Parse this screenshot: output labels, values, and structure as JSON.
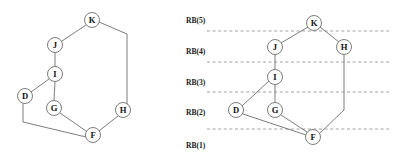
{
  "figure": {
    "width": 398,
    "height": 158,
    "background_color": "#ffffff",
    "node_fill_color": "#ffffff",
    "node_stroke_color": "#6e6e6e",
    "edge_color": "#6e6e6e",
    "band_line_color": "#8a8a8a",
    "label_color": "#111111"
  },
  "left_graph": {
    "name": "undecomposed-graph",
    "nodes": [
      {
        "id": "K",
        "label": "K",
        "x": 92,
        "y": 20,
        "r": 7.5
      },
      {
        "id": "J",
        "label": "J",
        "x": 55,
        "y": 45,
        "r": 7.5
      },
      {
        "id": "I",
        "label": "I",
        "x": 55,
        "y": 74,
        "r": 7.5
      },
      {
        "id": "D",
        "label": "D",
        "x": 25,
        "y": 96,
        "r": 7.5
      },
      {
        "id": "G",
        "label": "G",
        "x": 54,
        "y": 108,
        "r": 7.5
      },
      {
        "id": "H",
        "label": "H",
        "x": 123,
        "y": 110,
        "r": 7.5
      },
      {
        "id": "F",
        "label": "F",
        "x": 93,
        "y": 135,
        "r": 7.5
      }
    ],
    "edges": [
      {
        "from": "K",
        "to": "J",
        "points": [
          [
            86,
            25
          ],
          [
            62,
            41
          ]
        ]
      },
      {
        "from": "J",
        "to": "I",
        "points": [
          [
            55,
            53
          ],
          [
            55,
            66
          ]
        ]
      },
      {
        "from": "I",
        "to": "D",
        "points": [
          [
            49,
            79
          ],
          [
            31,
            92
          ]
        ]
      },
      {
        "from": "I",
        "to": "G",
        "points": [
          [
            55,
            82
          ],
          [
            54,
            100
          ]
        ]
      },
      {
        "from": "G",
        "to": "F",
        "points": [
          [
            60,
            113
          ],
          [
            86,
            131
          ]
        ]
      },
      {
        "from": "F",
        "to": "H",
        "points": [
          [
            99,
            131
          ],
          [
            118,
            116
          ]
        ]
      },
      {
        "from": "K",
        "to": "H",
        "points": [
          [
            99,
            22
          ],
          [
            127,
            34
          ],
          [
            127,
            104
          ],
          [
            129,
            106
          ]
        ]
      },
      {
        "from": "D",
        "to": "F",
        "points": [
          [
            23,
            104
          ],
          [
            23,
            122
          ],
          [
            86,
            137
          ]
        ]
      }
    ]
  },
  "right_graph": {
    "name": "level-decomposed-graph",
    "nodes": [
      {
        "id": "K",
        "label": "K",
        "x": 314,
        "y": 23,
        "r": 7.5
      },
      {
        "id": "J",
        "label": "J",
        "x": 275,
        "y": 47,
        "r": 7.5
      },
      {
        "id": "H",
        "label": "H",
        "x": 344,
        "y": 47,
        "r": 7.5
      },
      {
        "id": "I",
        "label": "I",
        "x": 275,
        "y": 77,
        "r": 7.5
      },
      {
        "id": "D",
        "label": "D",
        "x": 236,
        "y": 110,
        "r": 7.5
      },
      {
        "id": "G",
        "label": "G",
        "x": 275,
        "y": 110,
        "r": 7.5
      },
      {
        "id": "F",
        "label": "F",
        "x": 313,
        "y": 137,
        "r": 7.5
      }
    ],
    "edges": [
      {
        "from": "K",
        "to": "J",
        "points": [
          [
            308,
            27
          ],
          [
            281,
            43
          ]
        ]
      },
      {
        "from": "K",
        "to": "H",
        "points": [
          [
            320,
            27
          ],
          [
            339,
            42
          ]
        ]
      },
      {
        "from": "J",
        "to": "I",
        "points": [
          [
            275,
            55
          ],
          [
            275,
            69
          ]
        ]
      },
      {
        "from": "I",
        "to": "D",
        "points": [
          [
            269,
            81
          ],
          [
            242,
            106
          ]
        ]
      },
      {
        "from": "I",
        "to": "G",
        "points": [
          [
            275,
            85
          ],
          [
            275,
            102
          ]
        ]
      },
      {
        "from": "G",
        "to": "F",
        "points": [
          [
            281,
            115
          ],
          [
            307,
            132
          ]
        ]
      },
      {
        "from": "D",
        "to": "F",
        "points": [
          [
            243,
            114
          ],
          [
            306,
            135
          ]
        ]
      },
      {
        "from": "H",
        "to": "F",
        "points": [
          [
            344,
            55
          ],
          [
            344,
            110
          ],
          [
            319,
            134
          ]
        ]
      }
    ],
    "bands": [
      {
        "label": "RB(5)",
        "label_x": 186,
        "label_y": 20,
        "line_y": 31,
        "line_x1": 207,
        "line_x2": 390
      },
      {
        "label": "RB(4)",
        "label_x": 186,
        "label_y": 51,
        "line_y": 62,
        "line_x1": 207,
        "line_x2": 390
      },
      {
        "label": "RB(3)",
        "label_x": 186,
        "label_y": 82,
        "line_y": 92,
        "line_x1": 207,
        "line_x2": 390
      },
      {
        "label": "RB(2)",
        "label_x": 186,
        "label_y": 112,
        "line_y": 129,
        "line_x1": 207,
        "line_x2": 390
      },
      {
        "label": "RB(1)",
        "label_x": 186,
        "label_y": 145,
        "line_y": null,
        "line_x1": null,
        "line_x2": null
      }
    ]
  }
}
